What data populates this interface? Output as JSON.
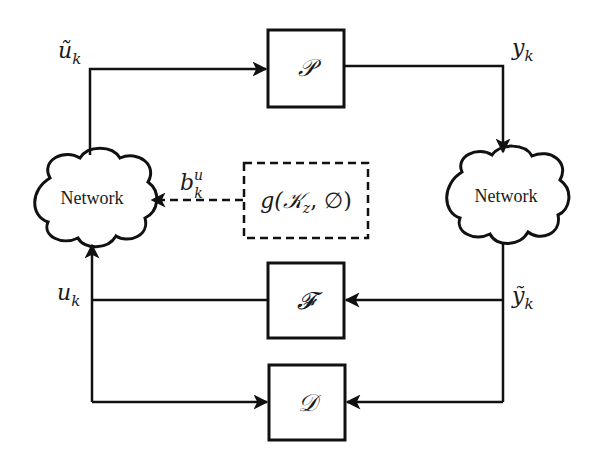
{
  "diagram": {
    "type": "networked control system block diagram",
    "blocks": {
      "plant": {
        "label": "𝒫",
        "name": "P"
      },
      "filter": {
        "label": "𝓕",
        "name": "F"
      },
      "detector": {
        "label": "𝒟",
        "name": "D"
      },
      "attack": {
        "label": "g(𝒦",
        "sub": "z",
        "tail": ", ∅)"
      }
    },
    "clouds": {
      "left": {
        "label": "Network"
      },
      "right": {
        "label": "Network"
      }
    },
    "signals": {
      "u_tilde": {
        "base": "ũ",
        "sub": "k"
      },
      "y": {
        "base": "y",
        "sub": "k"
      },
      "b": {
        "base": "b",
        "sub": "k",
        "sup": "u"
      },
      "u": {
        "base": "u",
        "sub": "k"
      },
      "y_tilde": {
        "base": "ỹ",
        "sub": "k"
      }
    }
  }
}
